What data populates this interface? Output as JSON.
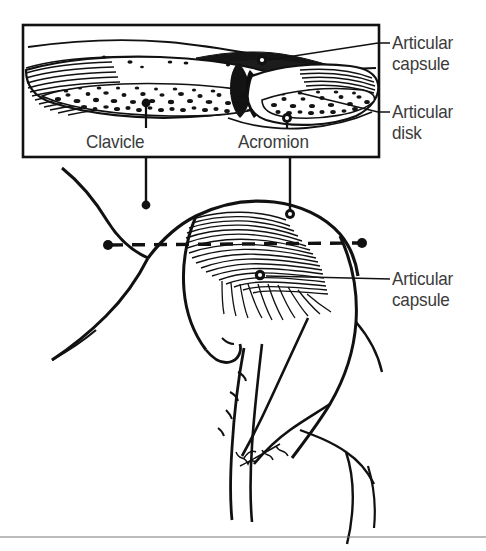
{
  "figure": {
    "background_color": "#ffffff",
    "ink_color": "#111111",
    "label_color": "#3b3b3b",
    "signature": "Wright"
  },
  "inset": {
    "name": "coronal-section-inset",
    "border_color": "#111111",
    "caption_note": "Coronal section through the acromioclavicular joint"
  },
  "labels": {
    "articular_capsule_inset": "Articular\ncapsule",
    "articular_disk": "Articular\ndisk",
    "articular_capsule_lower": "Articular\ncapsule",
    "clavicle": "Clavicle",
    "acromion": "Acromion"
  },
  "section_plane": {
    "name": "section-plane-dashed-line",
    "style": "dashed",
    "left_marker": "dot",
    "right_marker": "dot"
  }
}
